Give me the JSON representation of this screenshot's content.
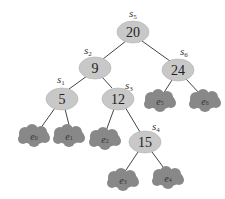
{
  "diagram": {
    "type": "binary-search-tree",
    "colors": {
      "internal_node": "#c8c8c8",
      "leaf_node": "#888888",
      "edge": "#444444"
    },
    "internal_nodes": [
      {
        "id": "s5",
        "label_base": "s",
        "label_sub": "5",
        "key": "20"
      },
      {
        "id": "s2",
        "label_base": "s",
        "label_sub": "2",
        "key": "9"
      },
      {
        "id": "s6",
        "label_base": "s",
        "label_sub": "6",
        "key": "24"
      },
      {
        "id": "s1",
        "label_base": "s",
        "label_sub": "1",
        "key": "5"
      },
      {
        "id": "s3",
        "label_base": "s",
        "label_sub": "3",
        "key": "12"
      },
      {
        "id": "s4",
        "label_base": "s",
        "label_sub": "4",
        "key": "15"
      }
    ],
    "leaves": [
      {
        "id": "e0",
        "label_base": "e",
        "label_sub": "0"
      },
      {
        "id": "e1",
        "label_base": "e",
        "label_sub": "1"
      },
      {
        "id": "e2",
        "label_base": "e",
        "label_sub": "2"
      },
      {
        "id": "e3",
        "label_base": "e",
        "label_sub": "3"
      },
      {
        "id": "e4",
        "label_base": "e",
        "label_sub": "4"
      },
      {
        "id": "e5",
        "label_base": "e",
        "label_sub": "5"
      },
      {
        "id": "e6",
        "label_base": "e",
        "label_sub": "6"
      }
    ],
    "edges": [
      [
        "s5",
        "s2"
      ],
      [
        "s5",
        "s6"
      ],
      [
        "s2",
        "s1"
      ],
      [
        "s2",
        "s3"
      ],
      [
        "s6",
        "e5"
      ],
      [
        "s6",
        "e6"
      ],
      [
        "s1",
        "e0"
      ],
      [
        "s1",
        "e1"
      ],
      [
        "s3",
        "e2"
      ],
      [
        "s3",
        "s4"
      ],
      [
        "s4",
        "e3"
      ],
      [
        "s4",
        "e4"
      ]
    ]
  }
}
